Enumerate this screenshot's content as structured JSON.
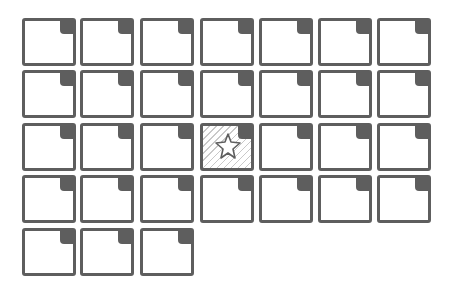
{
  "grid": {
    "columns": 7,
    "rows": 5,
    "col_x": [
      22,
      80,
      140,
      200,
      259,
      318,
      377
    ],
    "row_y": [
      18,
      70,
      123,
      175,
      228
    ],
    "tile_count": 31,
    "selected_index": 17,
    "selected_icon": "star-icon",
    "colors": {
      "border": "#5e5e5e",
      "corner": "#5e5e5e",
      "hatch": "#c9c9c9",
      "background": "#ffffff"
    }
  }
}
